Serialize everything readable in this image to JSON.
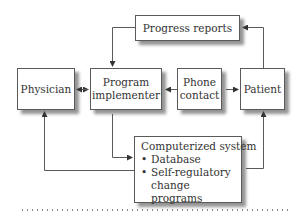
{
  "diagram": {
    "type": "flowchart",
    "nodes": {
      "progress_reports": {
        "label": "Progress reports"
      },
      "physician": {
        "label": "Physician"
      },
      "program_implementer": {
        "line1": "Program",
        "line2": "implementer"
      },
      "phone_contact": {
        "line1": "Phone",
        "line2": "contact"
      },
      "patient": {
        "label": "Patient"
      },
      "computerized_system": {
        "title": "Computerized system",
        "items": [
          {
            "label": "Database"
          },
          {
            "label": "Self-regulatory",
            "continuation": "change programs"
          }
        ]
      }
    },
    "edges": [
      {
        "from": "Patient",
        "to": "Progress reports"
      },
      {
        "from": "Progress reports",
        "to": "Program implementer"
      },
      {
        "from": "Physician",
        "to": "Program implementer",
        "bidirectional": true
      },
      {
        "from": "Phone contact",
        "to": "Program implementer"
      },
      {
        "from": "Phone contact",
        "to": "Patient"
      },
      {
        "from": "Program implementer",
        "to": "Computerized system"
      },
      {
        "from": "Computerized system",
        "to": "Physician"
      },
      {
        "from": "Computerized system",
        "to": "Patient"
      }
    ],
    "colors": {
      "line": "#5a5a5a",
      "text": "#333333",
      "shadow": "#3c3c3c"
    }
  }
}
